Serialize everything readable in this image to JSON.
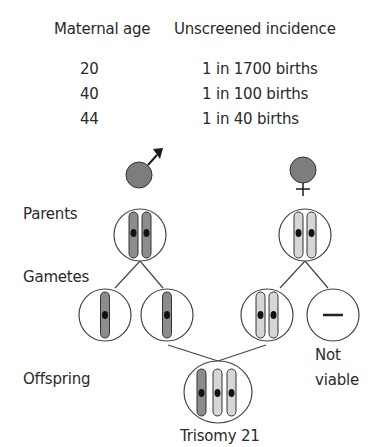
{
  "table": {
    "headers": [
      "Maternal age",
      "Unscreened incidence"
    ],
    "rows": [
      {
        "age": "20",
        "incidence": "1 in 1700 births"
      },
      {
        "age": "40",
        "incidence": "1 in 100 births"
      },
      {
        "age": "44",
        "incidence": "1 in 40 births"
      }
    ]
  },
  "labels": {
    "parents": "Parents",
    "gametes": "Gametes",
    "offspring": "Offspring",
    "not_viable_line1": "Not",
    "not_viable_line2": "viable",
    "trisomy": "Trisomy 21"
  },
  "symbols": {
    "male": "male-symbol",
    "female": "female-symbol"
  },
  "colors": {
    "symbol_fill": "#7d7d7d",
    "paternal_chromosome": "#8c8c8c",
    "maternal_chromosome": "#d6d6d6",
    "outline": "#333333",
    "centromere": "#111111"
  }
}
